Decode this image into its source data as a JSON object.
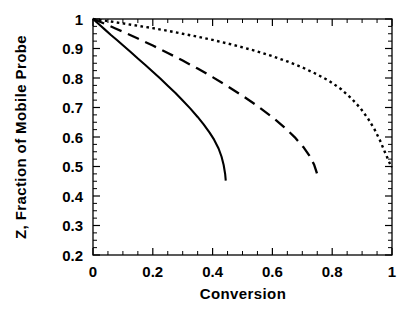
{
  "chart_data": {
    "type": "line",
    "title": "",
    "xlabel": "Conversion",
    "ylabel": "Z, Fraction of Mobile Probe",
    "xlim": [
      0,
      1
    ],
    "ylim": [
      0.2,
      1
    ],
    "grid": false,
    "legend": "none",
    "x_ticks": [
      0,
      0.2,
      0.4,
      0.6,
      0.8,
      1
    ],
    "x_tick_labels": [
      "0",
      "0.2",
      "0.4",
      "0.6",
      "0.8",
      "1"
    ],
    "x_minor_tick_step": 0.05,
    "y_ticks": [
      0.2,
      0.3,
      0.4,
      0.5,
      0.6,
      0.7,
      0.8,
      0.9,
      1
    ],
    "y_tick_labels": [
      "0.2",
      "0.3",
      "0.4",
      "0.5",
      "0.6",
      "0.7",
      "0.8",
      "0.9",
      "1"
    ],
    "y_minor_tick_step": 0.025,
    "series": [
      {
        "name": "solid",
        "style": "solid",
        "color": "#000000",
        "points": [
          [
            0.0,
            1.0
          ],
          [
            0.02,
            0.982
          ],
          [
            0.04,
            0.964
          ],
          [
            0.06,
            0.946
          ],
          [
            0.08,
            0.929
          ],
          [
            0.1,
            0.911
          ],
          [
            0.125,
            0.889
          ],
          [
            0.15,
            0.866
          ],
          [
            0.175,
            0.844
          ],
          [
            0.2,
            0.821
          ],
          [
            0.225,
            0.798
          ],
          [
            0.25,
            0.774
          ],
          [
            0.275,
            0.75
          ],
          [
            0.3,
            0.724
          ],
          [
            0.325,
            0.697
          ],
          [
            0.35,
            0.668
          ],
          [
            0.37,
            0.643
          ],
          [
            0.39,
            0.615
          ],
          [
            0.405,
            0.591
          ],
          [
            0.42,
            0.561
          ],
          [
            0.43,
            0.533
          ],
          [
            0.437,
            0.505
          ],
          [
            0.442,
            0.474
          ],
          [
            0.444,
            0.452
          ]
        ]
      },
      {
        "name": "long-dashed",
        "style": "dashed",
        "color": "#000000",
        "points": [
          [
            0.0,
            1.0
          ],
          [
            0.025,
            0.99
          ],
          [
            0.05,
            0.979
          ],
          [
            0.075,
            0.968
          ],
          [
            0.1,
            0.957
          ],
          [
            0.15,
            0.934
          ],
          [
            0.2,
            0.91
          ],
          [
            0.25,
            0.885
          ],
          [
            0.3,
            0.859
          ],
          [
            0.35,
            0.832
          ],
          [
            0.4,
            0.803
          ],
          [
            0.45,
            0.772
          ],
          [
            0.5,
            0.74
          ],
          [
            0.55,
            0.705
          ],
          [
            0.6,
            0.667
          ],
          [
            0.64,
            0.633
          ],
          [
            0.675,
            0.599
          ],
          [
            0.705,
            0.564
          ],
          [
            0.725,
            0.535
          ],
          [
            0.74,
            0.505
          ],
          [
            0.748,
            0.48
          ],
          [
            0.752,
            0.465
          ]
        ]
      },
      {
        "name": "dotted",
        "style": "dotted",
        "color": "#000000",
        "points": [
          [
            0.0,
            1.0
          ],
          [
            0.05,
            0.993
          ],
          [
            0.1,
            0.985
          ],
          [
            0.15,
            0.977
          ],
          [
            0.2,
            0.969
          ],
          [
            0.25,
            0.96
          ],
          [
            0.3,
            0.95
          ],
          [
            0.35,
            0.94
          ],
          [
            0.4,
            0.929
          ],
          [
            0.45,
            0.917
          ],
          [
            0.5,
            0.904
          ],
          [
            0.55,
            0.89
          ],
          [
            0.6,
            0.874
          ],
          [
            0.65,
            0.856
          ],
          [
            0.7,
            0.836
          ],
          [
            0.75,
            0.812
          ],
          [
            0.79,
            0.79
          ],
          [
            0.83,
            0.762
          ],
          [
            0.865,
            0.73
          ],
          [
            0.895,
            0.697
          ],
          [
            0.92,
            0.662
          ],
          [
            0.942,
            0.625
          ],
          [
            0.96,
            0.588
          ],
          [
            0.975,
            0.552
          ],
          [
            0.988,
            0.521
          ],
          [
            0.996,
            0.503
          ],
          [
            1.0,
            0.497
          ]
        ]
      }
    ]
  }
}
